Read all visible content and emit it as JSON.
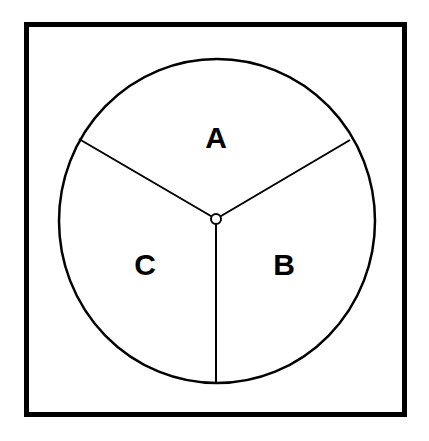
{
  "diagram": {
    "type": "spinner",
    "sections": [
      {
        "label": "A",
        "position": "top"
      },
      {
        "label": "B",
        "position": "bottom-right"
      },
      {
        "label": "C",
        "position": "bottom-left"
      }
    ],
    "stroke_color": "#000000",
    "background": "#ffffff"
  }
}
